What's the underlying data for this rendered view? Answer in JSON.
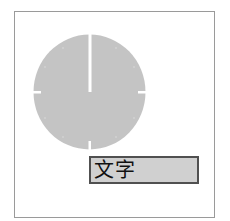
{
  "figure": {
    "clock": {
      "shape": "circle",
      "fill_color": "#c4c4c4",
      "tick_color": "#ffffff",
      "hand_color": "#ffffff",
      "hand_direction": "12 o'clock",
      "ticks": [
        "12",
        "3",
        "6",
        "9"
      ]
    },
    "label": {
      "text": "文字",
      "background_color": "#d0d0d0",
      "border_color": "#505050"
    },
    "frame_border_color": "#9a9a9a"
  }
}
